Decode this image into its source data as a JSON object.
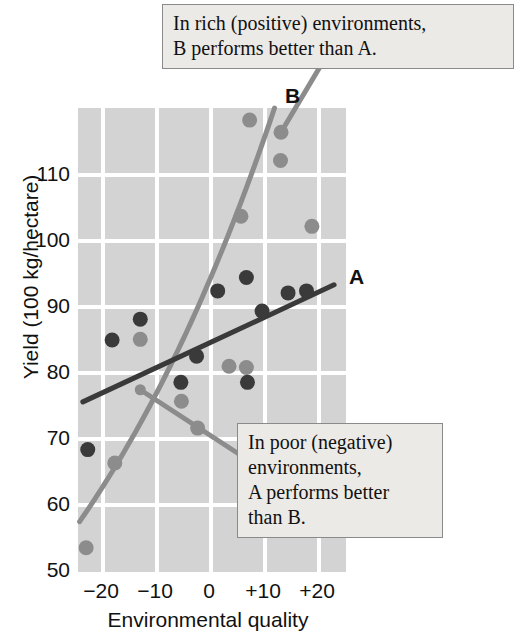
{
  "chart": {
    "type": "scatter",
    "title": "",
    "xlabel": "Environmental quality",
    "ylabel": "Yield (100 kg/hectare)",
    "xticks": [
      "−20",
      "−10",
      "0",
      "+10",
      "+20"
    ],
    "xtick_values": [
      -20,
      -10,
      0,
      10,
      20
    ],
    "yticks": [
      "50",
      "60",
      "70",
      "80",
      "90",
      "100",
      "110"
    ],
    "ytick_values": [
      50,
      60,
      70,
      80,
      90,
      100,
      110
    ],
    "xlim": [
      -24.5,
      25
    ],
    "ylim": [
      50,
      119
    ],
    "grid": true,
    "legend_position": "inline-end-labels",
    "series_labels": {
      "a": "A",
      "b": "B"
    },
    "colors": {
      "genotype_a": "#3a3a3a",
      "genotype_b": "#8c8c8c",
      "plot_background": "#d3d3d3",
      "gridline": "#ffffff",
      "callout_background": "#eceae6",
      "callout_border": "#8a8a8a",
      "text": "#111111"
    }
  },
  "chart_data": {
    "type": "scatter",
    "title": "",
    "xlabel": "Environmental quality",
    "ylabel": "Yield (100 kg/hectare)",
    "xlim": [
      -24.5,
      25
    ],
    "ylim": [
      50,
      119
    ],
    "grid": true,
    "xticks": [
      -20,
      -10,
      0,
      10,
      20
    ],
    "xtick_labels": [
      "−20",
      "−10",
      "0",
      "+10",
      "+20"
    ],
    "yticks": [
      50,
      60,
      70,
      80,
      90,
      100,
      110
    ],
    "ytick_labels": [
      "50",
      "60",
      "70",
      "80",
      "90",
      "100",
      "110"
    ],
    "legend_position": "inline-end-labels",
    "series": [
      {
        "name": "A",
        "label": "A",
        "color": "#3a3a3a",
        "marker": "circle",
        "points": [
          {
            "x": -22.7,
            "y": 68.2
          },
          {
            "x": -18.2,
            "y": 84.5
          },
          {
            "x": -13.0,
            "y": 87.6
          },
          {
            "x": -5.5,
            "y": 78.2
          },
          {
            "x": -2.6,
            "y": 82.1
          },
          {
            "x": 1.3,
            "y": 91.8
          },
          {
            "x": 6.6,
            "y": 93.8
          },
          {
            "x": 6.8,
            "y": 78.2
          },
          {
            "x": 9.5,
            "y": 88.8
          },
          {
            "x": 14.3,
            "y": 91.5
          },
          {
            "x": 17.7,
            "y": 91.8
          }
        ],
        "fit_line": {
          "kind": "linear",
          "x_start": -23.6,
          "y_start": 75.3,
          "x_end": 22.8,
          "y_end": 92.7
        }
      },
      {
        "name": "B",
        "label": "B",
        "color": "#8c8c8c",
        "marker": "circle",
        "points": [
          {
            "x": -23.0,
            "y": 53.6
          },
          {
            "x": -17.7,
            "y": 66.2
          },
          {
            "x": -13.0,
            "y": 84.6
          },
          {
            "x": -5.4,
            "y": 75.4
          },
          {
            "x": -2.4,
            "y": 71.4
          },
          {
            "x": 3.4,
            "y": 80.6
          },
          {
            "x": 6.6,
            "y": 80.4
          },
          {
            "x": 7.2,
            "y": 117.2
          },
          {
            "x": 5.6,
            "y": 102.9
          },
          {
            "x": 13.0,
            "y": 115.4
          },
          {
            "x": 12.9,
            "y": 111.2
          },
          {
            "x": 18.7,
            "y": 101.4
          }
        ],
        "fit_line": {
          "kind": "exponential-curve",
          "x_start": -24.2,
          "y_start": 57.5,
          "x_end": 11.8,
          "y_end": 119.0
        }
      }
    ],
    "annotations": [
      {
        "id": "callout-rich",
        "text": "In rich (positive) environments,\nB performs better than A.",
        "points_to": {
          "x": 13.0,
          "y": 115.4
        }
      },
      {
        "id": "callout-poor",
        "text": "In poor (negative) environments,\nA performs better\nthan B.",
        "points_to": {
          "x": -13.0,
          "y": 77.1
        }
      }
    ]
  },
  "annotations": {
    "top_callout": "In rich (positive) environments,\nB performs better than A.",
    "bottom_callout": "In poor (negative)\nenvironments,\nA performs better\nthan B."
  }
}
